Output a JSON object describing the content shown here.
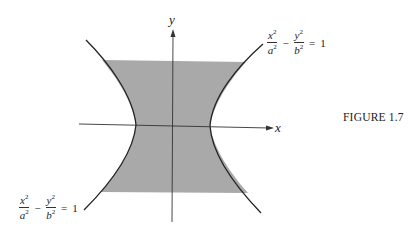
{
  "figure": {
    "caption": "FIGURE 1.7",
    "axes": {
      "x_label": "x",
      "y_label": "y"
    },
    "equation_top_right": {
      "num1": "x",
      "den1": "a",
      "num2": "y",
      "den2": "b",
      "exp": "2",
      "minus": "−",
      "equals": "=",
      "rhs": "1"
    },
    "equation_bottom_left": {
      "num1": "x",
      "den1": "a",
      "num2": "y",
      "den2": "b",
      "exp": "2",
      "minus": "−",
      "equals": "=",
      "rhs": "1"
    },
    "colors": {
      "shade": "#a9a9a9",
      "line": "#222222"
    }
  }
}
